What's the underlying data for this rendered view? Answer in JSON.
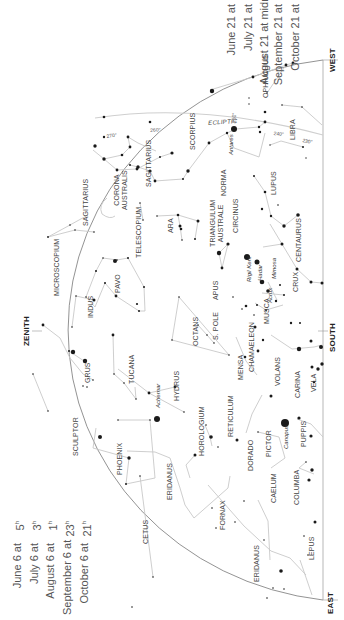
{
  "times_left": {
    "rows": [
      {
        "date": "June 6 at",
        "hour": "5",
        "suffix": "h"
      },
      {
        "date": "July 6 at",
        "hour": "3",
        "suffix": "h"
      },
      {
        "date": "August 6 at",
        "hour": "1",
        "suffix": "h"
      },
      {
        "date": "September 6 at",
        "hour": "23",
        "suffix": "h"
      },
      {
        "date": "October 6 at",
        "hour": "21",
        "suffix": "h"
      }
    ]
  },
  "times_right": {
    "rows": [
      {
        "date": "June 21 at",
        "hour": "4",
        "suffix": "h"
      },
      {
        "date": "July 21 at",
        "hour": "2",
        "suffix": "h"
      },
      {
        "date": "August 21 at midnight",
        "hour": "",
        "suffix": ""
      },
      {
        "date": "September 21 at",
        "hour": "22",
        "suffix": "h"
      },
      {
        "date": "October 21 at",
        "hour": "20",
        "suffix": "h"
      }
    ]
  },
  "directions": {
    "west": "WEST",
    "south": "SOUTH",
    "east": "EAST",
    "zenith": "ZENITH"
  },
  "ecliptic": {
    "label": "ECLIPTIC",
    "degrees": [
      "270°",
      "260°",
      "250°",
      "240°",
      "230°"
    ]
  },
  "constellations": {
    "ophiuchus": "OPHIUCHUS",
    "libra": "LIBRA",
    "scorpius": "SCORPIUS",
    "lupus": "LUPUS",
    "norma": "NORMA",
    "sagittarius_a": "SAGITTARIUS",
    "sagittarius_b": "SAGITTARIUS",
    "corona_australis_1": "CORONA",
    "corona_australis_2": "AUSTRALIS",
    "microscopium": "MICROSCOPIUM",
    "telescopium": "TELESCOPIUM",
    "ara": "ARA",
    "triangulum_australe_1": "TRIANGULUM",
    "triangulum_australe_2": "AUSTRALE",
    "circinus": "CIRCINUS",
    "centaurus": "CENTAURUS",
    "crux": "CRUX",
    "musca": "MUSCA",
    "pavo": "PAVO",
    "apus": "APUS",
    "indus": "INDUS",
    "octans": "OCTANS",
    "s_pole": "S. POLE",
    "chamaeleon": "CHAMAELEON",
    "grus": "GRUS",
    "tucana": "TUCANA",
    "hydrus": "HYDRUS",
    "mensa": "MENSA",
    "volans": "VOLANS",
    "carina": "CARINA",
    "vela": "VELA",
    "sculptor": "SCULPTOR",
    "phoenix": "PHOENIX",
    "horologium": "HOROLOGIUM",
    "reticulum": "RETICULUM",
    "dorado": "DORADO",
    "pictor": "PICTOR",
    "puppis": "PUPPIS",
    "eridanus_a": "ERIDANUS",
    "eridanus_b": "ERIDANUS",
    "caelum": "CAELUM",
    "columba": "COLUMBA",
    "cetus": "CETUS",
    "fornax": "FORNAX",
    "lepus": "LEPUS"
  },
  "stars": {
    "antares": "Antares",
    "rigil_kent": "Rigil Kent",
    "hadar": "Hadar",
    "mimosa": "Mimosa",
    "acrux": "Acrux",
    "achernar": "Achernar",
    "canopus": "Canopus"
  },
  "colors": {
    "lines": "#c8c8c8",
    "horizon": "#777777",
    "stars": "#1a1a1a",
    "text": "#444444"
  }
}
